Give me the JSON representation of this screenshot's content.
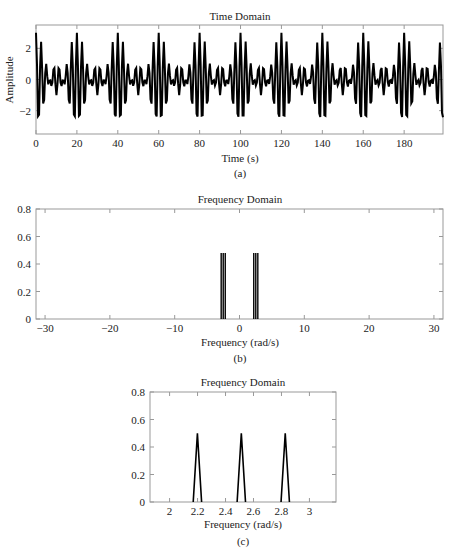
{
  "chart_data": [
    {
      "type": "line",
      "panel_label": "(a)",
      "title": "Time Domain",
      "xlabel": "Time (s)",
      "ylabel": "Amplitude",
      "xlim": [
        0,
        199
      ],
      "ylim": [
        -3.5,
        3.5
      ],
      "xticks": [
        0,
        20,
        40,
        60,
        80,
        100,
        120,
        140,
        160,
        180
      ],
      "yticks": [
        -2,
        0,
        2
      ],
      "grid": false,
      "series": [
        {
          "name": "x(t)",
          "formula": "sum of cosines",
          "components": [
            {
              "frequency_rad_s": 2.199,
              "amplitude": 1
            },
            {
              "frequency_rad_s": 2.513,
              "amplitude": 1
            },
            {
              "frequency_rad_s": 2.827,
              "amplitude": 1
            }
          ],
          "sample_step": 0.5,
          "peak_value": 3,
          "envelope_period_s": 20
        }
      ]
    },
    {
      "type": "line",
      "panel_label": "(b)",
      "title": "Frequency Domain",
      "xlabel": "Frequency (rad/s)",
      "ylabel": "",
      "xlim": [
        -31.4,
        31.4
      ],
      "ylim": [
        0,
        0.8
      ],
      "xticks": [
        -30,
        -20,
        -10,
        0,
        10,
        20,
        30
      ],
      "yticks": [
        0,
        0.2,
        0.4,
        0.6,
        0.8
      ],
      "ytick_labels": [
        "0",
        "0.2",
        "0.4",
        "0.6",
        "0.8"
      ],
      "grid": false,
      "series": [
        {
          "name": "|X(w)|",
          "x": [
            -2.827,
            -2.513,
            -2.199,
            2.199,
            2.513,
            2.827
          ],
          "values": [
            0.48,
            0.48,
            0.48,
            0.48,
            0.48,
            0.48
          ]
        }
      ]
    },
    {
      "type": "line",
      "panel_label": "(c)",
      "title": "Frequency Domain",
      "xlabel": "Frequency (rad/s)",
      "ylabel": "",
      "xlim": [
        1.86,
        3.19
      ],
      "ylim": [
        0,
        0.8
      ],
      "xticks": [
        2,
        2.2,
        2.4,
        2.6,
        2.8,
        3
      ],
      "xtick_labels": [
        "2",
        "2.2",
        "2.4",
        "2.6",
        "2.8",
        "3"
      ],
      "yticks": [
        0,
        0.2,
        0.4,
        0.6,
        0.8
      ],
      "ytick_labels": [
        "0",
        "0.2",
        "0.4",
        "0.6",
        "0.8"
      ],
      "grid": false,
      "series": [
        {
          "name": "|X(w)| zoom",
          "x": [
            2.199,
            2.513,
            2.827
          ],
          "values": [
            0.5,
            0.5,
            0.5
          ],
          "half_base_width": 0.03
        }
      ]
    }
  ],
  "colors": {
    "line": "#000000",
    "axis": "#999999",
    "text": "#222222"
  }
}
